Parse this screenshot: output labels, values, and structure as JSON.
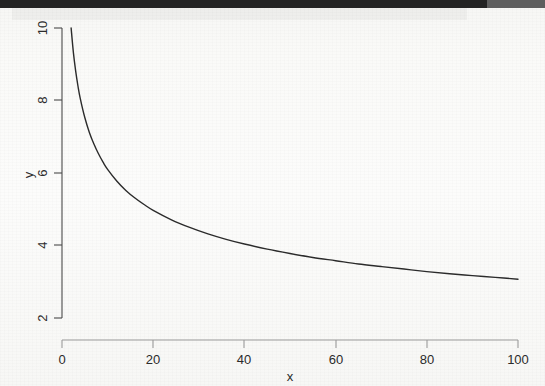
{
  "page": {
    "background_color": "#fbfbfa",
    "scan_edge_color": "#232323",
    "scan_edge_secondary_color": "#5e5e5e"
  },
  "chart_data": {
    "type": "line",
    "title": "",
    "subtitle": "",
    "xlabel": "x",
    "ylabel": "y",
    "xlim": [
      0,
      100
    ],
    "ylim": [
      2,
      10
    ],
    "xticks": [
      0,
      20,
      40,
      60,
      80,
      100
    ],
    "yticks": [
      2,
      4,
      6,
      8,
      10
    ],
    "xtick_labels": [
      "0",
      "20",
      "40",
      "60",
      "80",
      "100"
    ],
    "ytick_labels": [
      "2",
      "4",
      "6",
      "8",
      "10"
    ],
    "grid": false,
    "legend": null,
    "legend_position": "none",
    "line_color": "#2b2b2b",
    "line_width": 1.4,
    "ytick_label_rotation": -90,
    "series": [
      {
        "name": "y",
        "x": [
          2.0,
          2.5,
          3.0,
          3.5,
          4.0,
          5.0,
          6.0,
          7.0,
          8.0,
          9.0,
          10.0,
          12.0,
          14.0,
          16.0,
          18.0,
          20.0,
          24.0,
          28.0,
          32.0,
          36.0,
          40.0,
          45.0,
          50.0,
          55.0,
          60.0,
          65.0,
          70.0,
          75.0,
          80.0,
          85.0,
          90.0,
          95.0,
          100.0
        ],
        "y": [
          10.0,
          9.32,
          8.81,
          8.4,
          8.06,
          7.53,
          7.12,
          6.8,
          6.53,
          6.3,
          6.1,
          5.78,
          5.52,
          5.31,
          5.13,
          4.97,
          4.71,
          4.5,
          4.32,
          4.17,
          4.04,
          3.9,
          3.78,
          3.67,
          3.58,
          3.49,
          3.42,
          3.35,
          3.28,
          3.22,
          3.17,
          3.12,
          3.07
        ]
      }
    ]
  }
}
